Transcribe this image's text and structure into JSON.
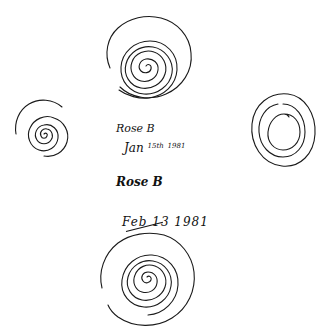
{
  "document": {
    "title": "Hand-drawn spiral samples",
    "annotations": [
      {
        "id": "name_1",
        "text": "Rose B"
      },
      {
        "id": "date_1_month",
        "text": "Jan"
      },
      {
        "id": "date_1_day_sup",
        "text": "15th"
      },
      {
        "id": "date_1_year",
        "text": "1981"
      },
      {
        "id": "name_2",
        "text": "Rose B"
      },
      {
        "id": "date_2",
        "text": "Feb 13 1981",
        "note": "partially struck through"
      }
    ],
    "labels": {
      "name_1": "Rose B",
      "date_1_month": "Jan",
      "date_1_day_sup": "15th",
      "date_1_year": "1981",
      "name_2": "Rose B",
      "date_2": "Feb 13 1981"
    },
    "drawings": [
      {
        "id": "spiral-top",
        "position": "top-center",
        "turns": 6
      },
      {
        "id": "spiral-left",
        "position": "middle-left",
        "turns": 4
      },
      {
        "id": "circles-right",
        "position": "middle-right",
        "turns": 3
      },
      {
        "id": "spiral-bottom",
        "position": "bottom-center",
        "turns": 6
      }
    ],
    "ink_color": "#1a1a1a",
    "background_color": "#ffffff"
  }
}
